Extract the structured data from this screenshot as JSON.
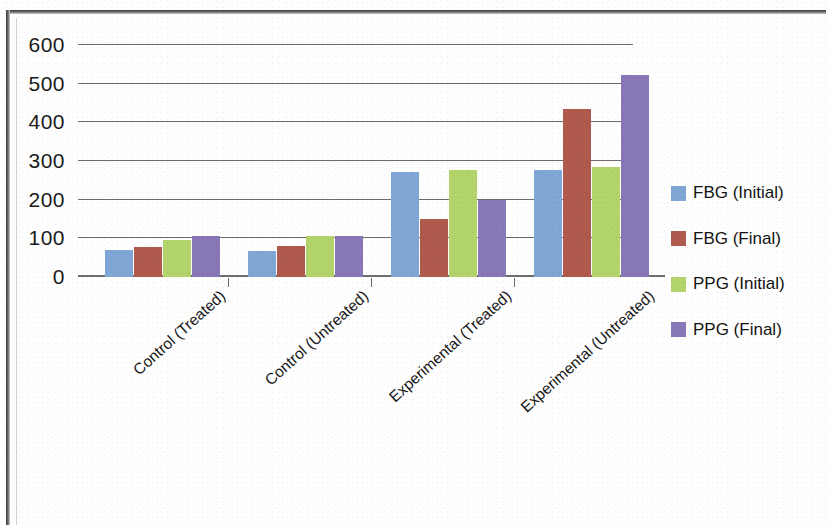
{
  "chart_data": {
    "type": "bar",
    "title": "",
    "subtitle": "",
    "xlabel": "",
    "ylabel": "",
    "ylim": [
      0,
      600
    ],
    "yticks": [
      0,
      100,
      200,
      300,
      400,
      500,
      600
    ],
    "ytick_labels": [
      "0",
      "100",
      "200",
      "300",
      "400",
      "500",
      "600"
    ],
    "grid": true,
    "legend_position": "right",
    "categories": [
      "Control (Treated)",
      "Control (Untreated)",
      "Experimental (Treated)",
      "Experimental (Untreated)"
    ],
    "series": [
      {
        "name": "FBG (Initial)",
        "color": "#7FA6D4",
        "values": [
          70,
          68,
          272,
          278
        ]
      },
      {
        "name": "FBG (Final)",
        "color": "#B05A4E",
        "values": [
          78,
          80,
          150,
          435
        ]
      },
      {
        "name": "PPG (Initial)",
        "color": "#B3D36B",
        "values": [
          97,
          105,
          278,
          285
        ]
      },
      {
        "name": "PPG (Final)",
        "color": "#8878B8",
        "values": [
          105,
          105,
          200,
          522
        ]
      }
    ]
  },
  "colors": {
    "axis": "#6d6d6d",
    "text": "#161616",
    "background": "#ffffff",
    "frame": "#3a3a3a"
  }
}
